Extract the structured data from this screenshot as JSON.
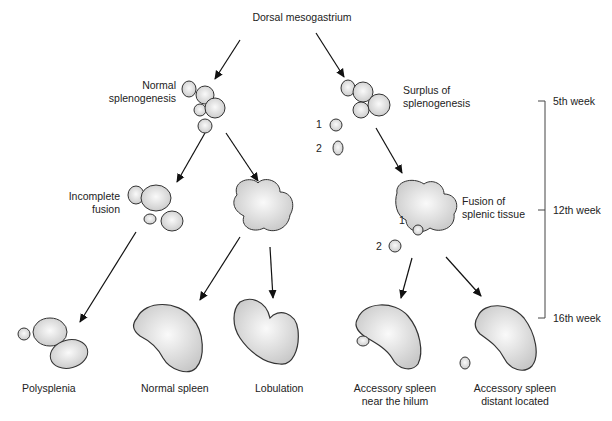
{
  "title": "Dorsal mesogastrium",
  "branches": {
    "normal": "Normal\nsplenogenesis",
    "surplus": "Surplus of\nsplenogenesis",
    "incomplete_fusion": "Incomplete\nfusion",
    "fusion": "Fusion of\nsplenic tissue"
  },
  "numbers": {
    "one": "1",
    "two": "2"
  },
  "outcomes": {
    "polysplenia": "Polysplenia",
    "normal_spleen": "Normal spleen",
    "lobulation": "Lobulation",
    "accessory_hilum": "Accessory spleen\nnear the hilum",
    "accessory_distant": "Accessory spleen\ndistant located"
  },
  "timeline": {
    "week5": "5th week",
    "week12": "12th week",
    "week16": "16th week"
  }
}
